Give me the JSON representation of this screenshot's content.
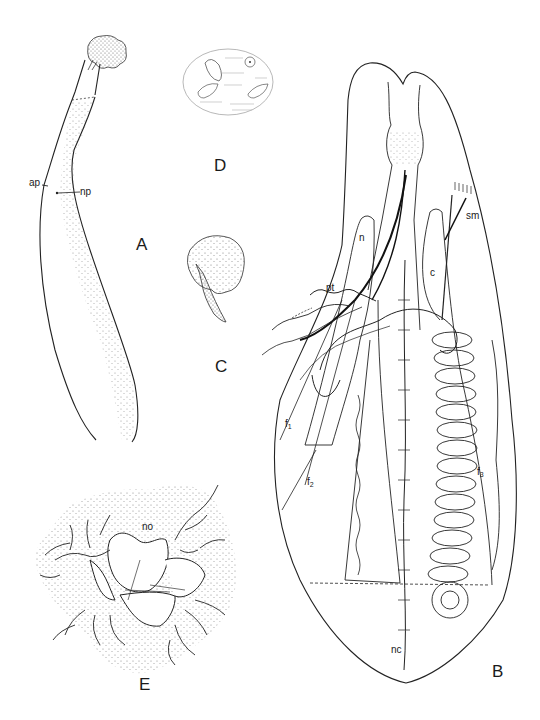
{
  "plate": {
    "figures": [
      {
        "id": "A",
        "label": "A",
        "parts": [
          {
            "label": "ap"
          },
          {
            "label": "np"
          }
        ]
      },
      {
        "id": "B",
        "label": "B",
        "parts": [
          {
            "label": "n"
          },
          {
            "label": "pt"
          },
          {
            "label": "sm"
          },
          {
            "label": "c"
          },
          {
            "label": "f",
            "sub": "1"
          },
          {
            "label": "f",
            "sub": "2"
          },
          {
            "label": "f",
            "sub": "3"
          },
          {
            "label": "nc"
          }
        ]
      },
      {
        "id": "C",
        "label": "C"
      },
      {
        "id": "D",
        "label": "D"
      },
      {
        "id": "E",
        "label": "E",
        "parts": [
          {
            "label": "no"
          }
        ]
      }
    ],
    "colors": {
      "ink": "#1a1a1a",
      "stipple": "#8a8a8a",
      "background": "#ffffff"
    }
  }
}
